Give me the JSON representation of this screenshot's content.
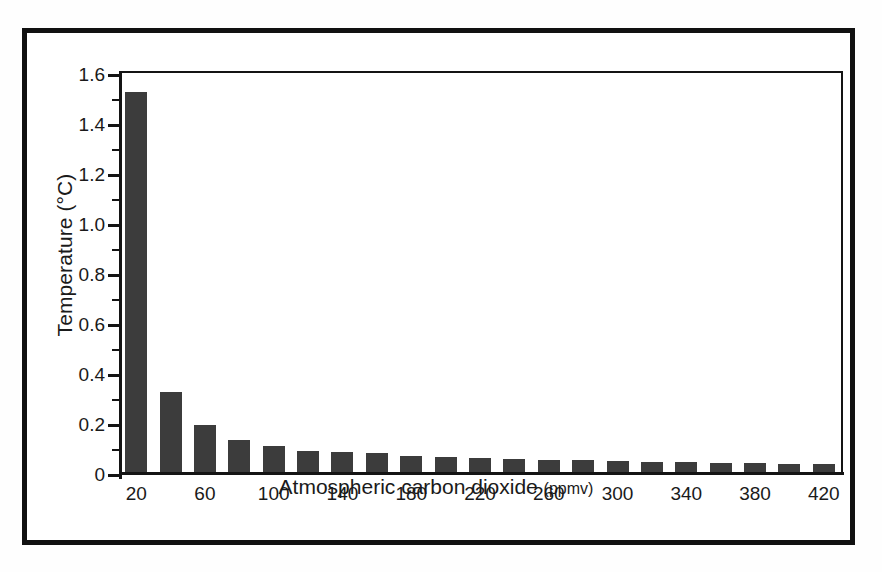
{
  "chart_data": {
    "type": "bar",
    "title": "",
    "xlabel": "Atmospheric carbon dioxide",
    "xlabel_unit": "(ppmv)",
    "ylabel": "Temperature (°C)",
    "categories": [
      20,
      40,
      60,
      80,
      100,
      120,
      140,
      160,
      180,
      200,
      220,
      240,
      260,
      280,
      300,
      320,
      340,
      360,
      380,
      400,
      420
    ],
    "values": [
      1.52,
      0.32,
      0.19,
      0.13,
      0.105,
      0.085,
      0.08,
      0.075,
      0.065,
      0.06,
      0.055,
      0.052,
      0.05,
      0.048,
      0.045,
      0.042,
      0.04,
      0.038,
      0.036,
      0.034,
      0.032
    ],
    "ylim": [
      0,
      1.6
    ],
    "xlim": [
      10,
      430
    ],
    "y_major_ticks": [
      0,
      0.2,
      0.4,
      0.6,
      0.8,
      1.0,
      1.2,
      1.4,
      1.6
    ],
    "y_major_tick_labels": [
      "0",
      "0.2",
      "0.4",
      "0.6",
      "0.8",
      "1.0",
      "1.2",
      "1.4",
      "1.6"
    ],
    "y_minor_ticks": [
      0.1,
      0.3,
      0.5,
      0.7,
      0.9,
      1.1,
      1.3,
      1.5
    ],
    "x_tick_labels": [
      "20",
      "60",
      "100",
      "140",
      "180",
      "220",
      "260",
      "300",
      "340",
      "380",
      "420"
    ],
    "x_tick_values": [
      20,
      60,
      100,
      140,
      180,
      220,
      260,
      300,
      340,
      380,
      420
    ],
    "grid": false,
    "legend": null,
    "bar_color": "#3c3c3c",
    "axis_color": "#141414",
    "frame_color": "#111111",
    "background": "#ffffff"
  }
}
